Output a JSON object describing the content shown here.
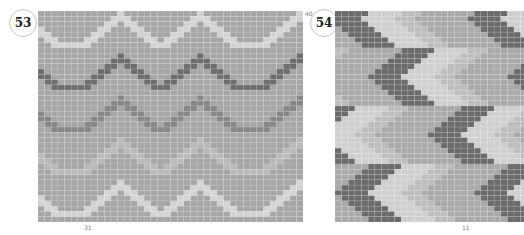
{
  "charts": [
    {
      "number": "53",
      "row_label": "40",
      "bottom_label": "31",
      "rows": 40,
      "cols": 40,
      "background": "#a6a6a6",
      "wave_profile": [
        3,
        2,
        1,
        0,
        0,
        0,
        0,
        1,
        2,
        3,
        4,
        5,
        6,
        5,
        4,
        3,
        2,
        1,
        0,
        1,
        2,
        3,
        4,
        5,
        6,
        5,
        4,
        3,
        2,
        1,
        0,
        0,
        0,
        0,
        1,
        2,
        3,
        4,
        5,
        6
      ],
      "waves": [
        {
          "name": "light-wave-top",
          "color": "#d3d3d3",
          "base_row": 6
        },
        {
          "name": "dark-wave",
          "color": "#6e6e6e",
          "base_row": 14
        },
        {
          "name": "medium-wave",
          "color": "#878787",
          "base_row": 22
        },
        {
          "name": "faint-wave",
          "color": "#bababa",
          "base_row": 30
        },
        {
          "name": "light-wave-bottom",
          "color": "#d3d3d3",
          "base_row": 38
        }
      ]
    },
    {
      "number": "54",
      "bottom_label": "11",
      "rows": 40,
      "cols": 29,
      "background": "#a9a9a9",
      "period_cols": 21,
      "chevron_half_height": 5,
      "chevrons": [
        {
          "tip_col": -1,
          "tip_row": 1
        },
        {
          "tip_col": 5,
          "tip_row": 12
        },
        {
          "tip_col": 14,
          "tip_row": 23
        },
        {
          "tip_col": 0,
          "tip_row": 34
        }
      ],
      "bands": [
        {
          "name": "dark",
          "color": "#6b6b6b",
          "from": 0,
          "to": 4
        },
        {
          "name": "light",
          "color": "#cfcfcf",
          "from": 5,
          "to": 9
        },
        {
          "name": "pale",
          "color": "#bdbdbd",
          "from": 10,
          "to": 12
        }
      ]
    }
  ]
}
